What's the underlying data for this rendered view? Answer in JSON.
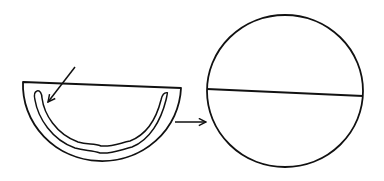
{
  "diagram": {
    "background": "#ffffff",
    "stroke_color": "#111111",
    "elements": [
      {
        "id": "half-disk",
        "shape": "semicircle",
        "description": "half-disk bowl with inner wavy band"
      },
      {
        "id": "inner-band",
        "shape": "wavy-u-band"
      },
      {
        "id": "pointer-arrow",
        "shape": "arrow",
        "points_to": "inner-band"
      },
      {
        "id": "connector-arrow",
        "shape": "arrow",
        "from": "half-disk",
        "to": "full-circle"
      },
      {
        "id": "full-circle",
        "shape": "circle",
        "description": "full circle with a horizontal diameter line"
      },
      {
        "id": "diameter-line",
        "shape": "line"
      }
    ]
  }
}
